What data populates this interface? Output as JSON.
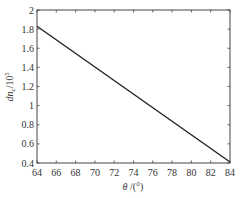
{
  "chart_data": {
    "type": "line",
    "title": "",
    "xlabel": "θ /(°)",
    "ylabel": "dn_c/10^5",
    "xlim": [
      64,
      84
    ],
    "ylim": [
      0.4,
      2.0
    ],
    "xticks": [
      64,
      66,
      68,
      70,
      72,
      74,
      76,
      78,
      80,
      82,
      84
    ],
    "yticks": [
      0.4,
      0.6,
      0.8,
      1.0,
      1.2,
      1.4,
      1.6,
      1.8,
      2.0
    ],
    "ytick_labels": [
      "0.4",
      "0.6",
      "0.8",
      "1",
      "1.2",
      "1.4",
      "1.6",
      "1.8",
      "2"
    ],
    "grid": false,
    "legend": null,
    "series": [
      {
        "name": "dn_c",
        "x": [
          64,
          84
        ],
        "y": [
          1.83,
          0.41
        ],
        "color": "#222222"
      }
    ]
  },
  "labels": {
    "xlabel_theta": "θ",
    "xlabel_unit": " /(°)",
    "ylabel_main": "dn",
    "ylabel_sub": "c",
    "ylabel_unit": "/10",
    "ylabel_exp": "5"
  }
}
